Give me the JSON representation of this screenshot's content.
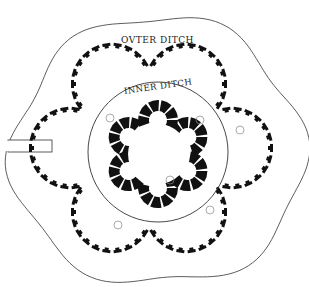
{
  "diagram": {
    "type": "site-plan",
    "labels": {
      "outer_ditch": "OVTER DITCH",
      "inner_ditch": "INNER DITCH"
    },
    "colors": {
      "background": "#ffffff",
      "line": "#333333",
      "rampart_fill": "#111111",
      "wall_fill": "#111111"
    },
    "center": {
      "x": 158,
      "y": 150
    },
    "outer_rampart": {
      "lobes": 6,
      "lobe_radius": 40,
      "lobe_centers": [
        {
          "x": 112,
          "y": 84
        },
        {
          "x": 186,
          "y": 84
        },
        {
          "x": 232,
          "y": 148
        },
        {
          "x": 186,
          "y": 212
        },
        {
          "x": 112,
          "y": 212
        },
        {
          "x": 70,
          "y": 148
        }
      ]
    },
    "inner_ditch_circle": {
      "cx": 158,
      "cy": 152,
      "r": 70
    },
    "inner_flower": {
      "lobes": 6,
      "lobe_radius": 20,
      "ring_radius": 34
    },
    "entrance": {
      "x": 12,
      "y": 140,
      "width": 40,
      "height": 12
    }
  }
}
